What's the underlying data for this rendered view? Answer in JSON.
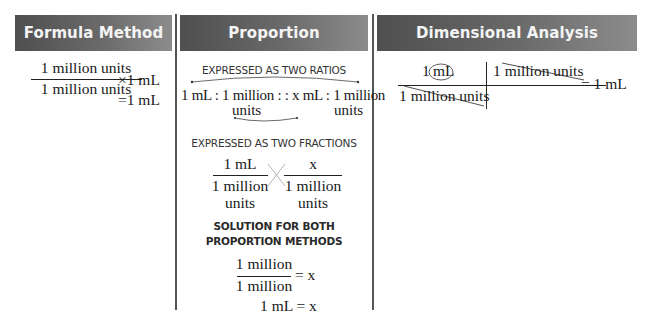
{
  "headers": {
    "formula": "Formula Method",
    "proportion": "Proportion",
    "dimensional": "Dimensional Analysis"
  },
  "colors": {
    "header_dark": "#4f4f4f",
    "header_light": "#8c8c8c",
    "header_text": "#f4f4f4",
    "divider": "#555555"
  },
  "formula": {
    "numerator": "1 million units",
    "denominator": "1 million units",
    "multiplier": "×1 mL",
    "result": "=1 mL"
  },
  "proportion": {
    "ratios_label": "EXPRESSED AS TWO RATIOS",
    "ratio_line1": "1 mL : 1 million : : x mL : 1 million",
    "ratio_units_left": "units",
    "ratio_units_right": "units",
    "fractions_label": "EXPRESSED AS TWO FRACTIONS",
    "frac1_num": "1 mL",
    "frac1_den_line1": "1 million",
    "frac1_den_line2": "units",
    "frac2_num": "x",
    "frac2_den_line1": "1 million",
    "frac2_den_line2": "units",
    "solution_label_line1": "SOLUTION FOR BOTH",
    "solution_label_line2": "PROPORTION METHODS",
    "solution_num": "1 million",
    "solution_den": "1 million",
    "solution_eq": "= x",
    "final": "1 mL = x"
  },
  "dimensional": {
    "num_left_prefix": "1",
    "num_left_unit": "mL",
    "den_left": "1 million units",
    "num_right": "1 million units",
    "result": "= 1 mL"
  }
}
